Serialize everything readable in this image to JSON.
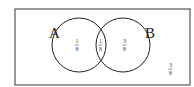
{
  "diagram": {
    "type": "venn",
    "sets": [
      {
        "label": "A"
      },
      {
        "label": "B"
      }
    ],
    "regions": {
      "a_only": {
        "numerator": "1",
        "denominator": "8"
      },
      "intersection": {
        "numerator": "1",
        "denominator": "8"
      },
      "b_only": {
        "numerator": "3",
        "denominator": "8"
      },
      "outside": {
        "numerator": "3",
        "denominator": "8"
      }
    },
    "colors": {
      "stroke": "#222222",
      "background": "#ffffff"
    }
  }
}
